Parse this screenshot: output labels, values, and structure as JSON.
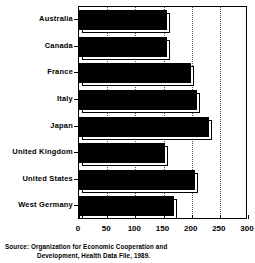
{
  "chart_data": {
    "type": "bar",
    "orientation": "horizontal",
    "title": "",
    "xlabel": "",
    "ylabel": "",
    "categories": [
      "Australia",
      "Canada",
      "France",
      "Italy",
      "Japan",
      "United Kingdom",
      "United States",
      "West Germany"
    ],
    "values": [
      157,
      157,
      199,
      209,
      230,
      152,
      206,
      168
    ],
    "xlim": [
      0,
      300
    ],
    "xticks": [
      0,
      50,
      100,
      150,
      200,
      250,
      300
    ],
    "xtick_labels": [
      "0",
      "50",
      "100",
      "150",
      "200",
      "250",
      "300"
    ],
    "grid": "vertical-dotted",
    "legend": "none",
    "bar_color": "#000000",
    "bar_style": "shadowed-3d",
    "background": "#ffffff"
  },
  "source": {
    "label": "Source:",
    "line1": "Organization for Economic Cooperation and",
    "line2": "Development, Health Data File, 1989."
  }
}
